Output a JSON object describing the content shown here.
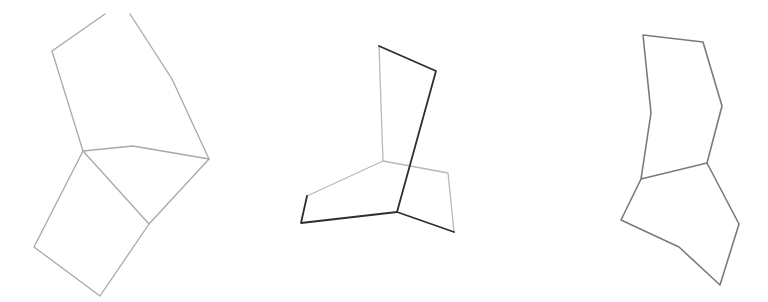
{
  "canvas": {
    "width": 768,
    "height": 302,
    "background": "#ffffff"
  },
  "figures": [
    {
      "id": "figure-1",
      "description": "Two-quadrilateral folded shape (light gray strokes)",
      "stroke": "#a8a8a8",
      "top_polygon": [
        [
          52,
          51
        ],
        [
          105,
          14
        ]
      ],
      "top_polygon_right": [
        [
          130,
          14
        ],
        [
          172,
          79
        ],
        [
          209,
          159
        ]
      ],
      "middle_edge": [
        [
          83,
          151
        ],
        [
          133,
          146
        ],
        [
          209,
          159
        ]
      ],
      "left_edge": [
        [
          52,
          51
        ],
        [
          83,
          151
        ]
      ],
      "bottom_polygon": [
        [
          83,
          151
        ],
        [
          149,
          224
        ],
        [
          209,
          159
        ]
      ],
      "bottom_square": [
        [
          83,
          151
        ],
        [
          34,
          247
        ],
        [
          100,
          296
        ],
        [
          149,
          224
        ]
      ]
    },
    {
      "id": "figure-2",
      "description": "Overlapping shapes with one dark-outlined polygon",
      "light_stroke": "#b0b0b0",
      "dark_stroke": "#2e2e2e",
      "dark_path": [
        [
          379,
          46
        ],
        [
          436,
          71
        ],
        [
          397,
          212
        ],
        [
          301,
          223
        ],
        [
          307,
          196
        ]
      ],
      "dark_branch": [
        [
          397,
          212
        ],
        [
          454,
          232
        ]
      ],
      "light_paths": [
        [
          [
            379,
            46
          ],
          [
            383,
            161
          ]
        ],
        [
          [
            307,
            196
          ],
          [
            383,
            161
          ],
          [
            448,
            173
          ],
          [
            454,
            232
          ]
        ]
      ]
    },
    {
      "id": "figure-3",
      "description": "Two stacked polygons (medium gray strokes)",
      "stroke": "#7a7a7a",
      "top_polygon": [
        [
          643,
          35
        ],
        [
          703,
          42
        ],
        [
          722,
          106
        ],
        [
          707,
          163
        ],
        [
          641,
          179
        ],
        [
          651,
          113
        ]
      ],
      "bottom_polygon": [
        [
          641,
          179
        ],
        [
          621,
          220
        ],
        [
          679,
          247
        ],
        [
          720,
          285
        ],
        [
          739,
          224
        ],
        [
          707,
          163
        ]
      ]
    }
  ]
}
